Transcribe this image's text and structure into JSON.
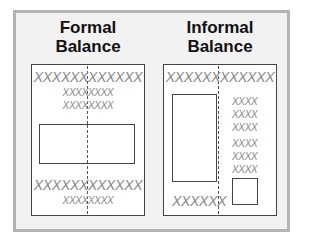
{
  "figure": {
    "left": {
      "title_line1": "Formal",
      "title_line2": "Balance",
      "top_line": "XXXXXXXXXXXX",
      "sub_line1": "XXXXXXXX",
      "sub_line2": "XXXXXXXX",
      "bottom_line": "XXXXXXXXXXXX",
      "bottom_sub": "XXXXXXXX"
    },
    "right": {
      "title_line1": "Informal",
      "title_line2": "Balance",
      "top_line": "XXXXXXXXXXXX",
      "side_items": [
        "XXXX",
        "XXXX",
        "XXXX",
        "XXXX",
        "XXXX",
        "XXXX"
      ],
      "bottom_line": "XXXXXX"
    }
  }
}
